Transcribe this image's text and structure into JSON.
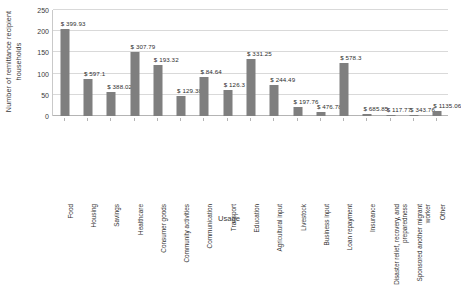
{
  "chart_data": {
    "type": "bar",
    "title": "",
    "xlabel": "Usage",
    "ylabel": "Number of remittance recipient households",
    "ylim": [
      0,
      250
    ],
    "yticks": [
      0,
      50,
      100,
      150,
      200,
      250
    ],
    "ytick_labels": [
      "0",
      "50",
      "100",
      "150",
      "200",
      "250"
    ],
    "grid": true,
    "legend": "none",
    "bar_color": "#7f7f7f",
    "categories": [
      "Food",
      "Housing",
      "Savings",
      "Healthcare",
      "Consumer goods",
      "Community activities",
      "Communication",
      "Transport",
      "Education",
      "Agricultural input",
      "Livestock",
      "Business input",
      "Loan repayment",
      "Insurance",
      "Disaster relief, recovery, and preparedness",
      "Sponsored another migrant worker",
      "Other"
    ],
    "values": [
      205,
      88,
      57,
      152,
      120,
      48,
      92,
      62,
      135,
      72,
      22,
      10,
      125,
      5,
      3,
      3,
      12
    ],
    "point_labels": [
      "$ 399.93",
      "$ 597.1",
      "$ 388.02",
      "$ 307.79",
      "$ 193.32",
      "$ 129.38",
      "$ 84.64",
      "$ 126.3",
      "$ 331.25",
      "$ 244.49",
      "$ 197.76",
      "$ 476.78",
      "$ 578.3",
      "$ 685.85",
      "$ 117.77",
      "$ 343.76",
      "$ 1135.06"
    ]
  }
}
